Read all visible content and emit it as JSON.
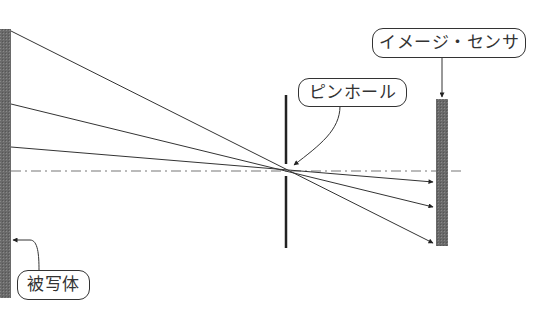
{
  "diagram": {
    "type": "pinhole-camera-optics",
    "labels": {
      "subject": "被写体",
      "pinhole": "ピンホール",
      "image_sensor": "イメージ・センサ"
    },
    "colors": {
      "line": "#333333",
      "plate": "#666666",
      "axis": "#777777"
    },
    "rays_count": 3
  }
}
